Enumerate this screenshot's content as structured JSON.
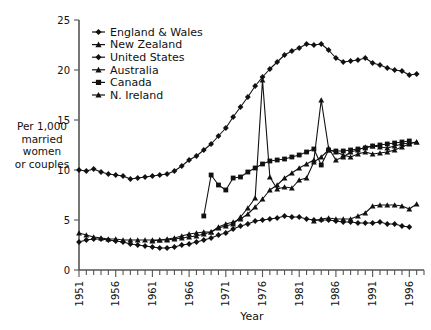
{
  "chart_data": {
    "type": "line",
    "title": "",
    "xlabel": "Year",
    "ylabel": "Per 1,000 married women or couples",
    "ylabel_lines": [
      "Per 1,000",
      "married",
      "women",
      "or couples"
    ],
    "xlim": [
      1951,
      1998
    ],
    "ylim": [
      0,
      25
    ],
    "yticks": [
      0,
      5,
      10,
      15,
      20,
      25
    ],
    "xticks_labeled": [
      1951,
      1956,
      1961,
      1966,
      1971,
      1976,
      1981,
      1986,
      1991,
      1996
    ],
    "xtick_step_minor": 1,
    "grid": false,
    "legend_position": "top-left-inside",
    "series": [
      {
        "name": "England & Wales",
        "marker": "diamond",
        "x": [
          1951,
          1952,
          1953,
          1954,
          1955,
          1956,
          1957,
          1958,
          1959,
          1960,
          1961,
          1962,
          1963,
          1964,
          1965,
          1966,
          1967,
          1968,
          1969,
          1970,
          1971,
          1972,
          1973,
          1974,
          1975,
          1976,
          1977,
          1978,
          1979,
          1980,
          1981,
          1982,
          1983,
          1984,
          1985,
          1986,
          1987,
          1988,
          1989,
          1990,
          1991,
          1992,
          1993,
          1994,
          1995,
          1996,
          1997
        ],
        "values": [
          10.0,
          9.9,
          10.1,
          9.8,
          9.6,
          9.5,
          9.4,
          9.1,
          9.2,
          9.3,
          9.4,
          9.5,
          9.6,
          9.9,
          10.4,
          11.0,
          11.4,
          12.0,
          12.6,
          13.4,
          14.2,
          15.3,
          16.3,
          17.3,
          18.4,
          19.3,
          20.1,
          20.8,
          21.5,
          21.9,
          22.2,
          22.6,
          22.5,
          22.6,
          22.0,
          21.2,
          20.8,
          20.9,
          21.0,
          21.2,
          20.7,
          20.5,
          20.2,
          20.0,
          19.9,
          19.5,
          19.6
        ]
      },
      {
        "name": "New Zealand",
        "marker": "triangle",
        "x": [
          1951,
          1952,
          1953,
          1954,
          1955,
          1956,
          1957,
          1958,
          1959,
          1960,
          1961,
          1962,
          1963,
          1964,
          1965,
          1966,
          1967,
          1968,
          1969,
          1970,
          1971,
          1972,
          1973,
          1974,
          1975,
          1976,
          1977,
          1978,
          1979,
          1980,
          1981,
          1982,
          1983,
          1984,
          1985,
          1986,
          1987,
          1988,
          1989,
          1990,
          1991,
          1992,
          1993,
          1994,
          1995,
          1996,
          1997
        ],
        "values": [
          3.7,
          3.5,
          3.3,
          3.2,
          3.1,
          3.1,
          3.0,
          3.0,
          3.0,
          3.0,
          3.0,
          3.0,
          3.1,
          3.2,
          3.4,
          3.6,
          3.7,
          3.8,
          3.8,
          4.2,
          4.4,
          4.6,
          5.3,
          6.2,
          7.2,
          19.0,
          9.3,
          8.1,
          8.3,
          8.2,
          9.0,
          9.2,
          10.8,
          11.3,
          12.0,
          11.8,
          11.5,
          11.3,
          11.6,
          11.8,
          11.6,
          11.7,
          11.8,
          12.0,
          12.3,
          12.6,
          12.8
        ]
      },
      {
        "name": "United States",
        "marker": "diamond",
        "x": [
          1951,
          1952,
          1953,
          1954,
          1955,
          1956,
          1957,
          1958,
          1959,
          1960,
          1961,
          1962,
          1963,
          1964,
          1965,
          1966,
          1967,
          1968,
          1969,
          1970,
          1971,
          1972,
          1973,
          1974,
          1975,
          1976,
          1977,
          1978,
          1979,
          1980,
          1981,
          1982,
          1983,
          1984,
          1985,
          1986,
          1987,
          1988,
          1989,
          1990,
          1991,
          1992,
          1993,
          1994,
          1995,
          1996
        ],
        "values": [
          2.8,
          3.0,
          3.1,
          3.1,
          3.0,
          2.9,
          2.8,
          2.6,
          2.5,
          2.4,
          2.3,
          2.2,
          2.2,
          2.3,
          2.5,
          2.6,
          2.8,
          3.0,
          3.2,
          3.5,
          3.7,
          4.1,
          4.4,
          4.6,
          4.9,
          5.0,
          5.1,
          5.2,
          5.4,
          5.3,
          5.3,
          5.1,
          5.0,
          5.0,
          5.0,
          4.9,
          4.8,
          4.8,
          4.7,
          4.7,
          4.7,
          4.8,
          4.6,
          4.6,
          4.4,
          4.3
        ]
      },
      {
        "name": "Australia",
        "marker": "triangle",
        "x": [
          1961,
          1962,
          1963,
          1964,
          1965,
          1966,
          1967,
          1968,
          1969,
          1970,
          1971,
          1972,
          1973,
          1974,
          1975,
          1976,
          1977,
          1978,
          1979,
          1980,
          1981,
          1982,
          1983,
          1984,
          1985,
          1986,
          1987,
          1988,
          1989,
          1990,
          1991,
          1992,
          1993,
          1994,
          1995,
          1996,
          1997
        ],
        "values": [
          2.9,
          3.0,
          3.0,
          3.1,
          3.2,
          3.3,
          3.4,
          3.6,
          3.8,
          4.3,
          4.6,
          4.8,
          5.1,
          5.6,
          6.3,
          7.1,
          8.0,
          8.5,
          9.2,
          9.7,
          10.2,
          10.6,
          11.0,
          17.0,
          12.2,
          11.0,
          11.3,
          11.8,
          12.0,
          12.3,
          12.4,
          12.3,
          12.2,
          12.4,
          12.6,
          12.7,
          12.8
        ]
      },
      {
        "name": "Canada",
        "marker": "square",
        "x": [
          1968,
          1969,
          1970,
          1971,
          1972,
          1973,
          1974,
          1975,
          1976,
          1977,
          1978,
          1979,
          1980,
          1981,
          1982,
          1983,
          1984,
          1985,
          1986,
          1987,
          1988,
          1989,
          1990,
          1991,
          1992,
          1993,
          1994,
          1995,
          1996
        ],
        "values": [
          5.4,
          9.5,
          8.5,
          8.0,
          9.2,
          9.3,
          9.8,
          10.2,
          10.6,
          10.9,
          11.0,
          11.1,
          11.3,
          11.5,
          11.8,
          12.1,
          10.5,
          12.0,
          11.9,
          11.9,
          12.0,
          12.1,
          12.2,
          12.4,
          12.5,
          12.6,
          12.7,
          12.8,
          12.9
        ]
      },
      {
        "name": "N. Ireland",
        "marker": "triangle",
        "x": [
          1983,
          1984,
          1985,
          1986,
          1987,
          1988,
          1989,
          1990,
          1991,
          1992,
          1993,
          1994,
          1995,
          1996,
          1997
        ],
        "values": [
          4.9,
          5.1,
          5.2,
          5.1,
          5.1,
          5.1,
          5.4,
          5.7,
          6.4,
          6.5,
          6.5,
          6.5,
          6.4,
          6.1,
          6.6
        ]
      }
    ],
    "legend": [
      {
        "label": "England & Wales",
        "marker": "diamond"
      },
      {
        "label": "New Zealand",
        "marker": "triangle"
      },
      {
        "label": "United States",
        "marker": "diamond"
      },
      {
        "label": "Australia",
        "marker": "triangle"
      },
      {
        "label": "Canada",
        "marker": "square"
      },
      {
        "label": "N. Ireland",
        "marker": "triangle"
      }
    ]
  }
}
